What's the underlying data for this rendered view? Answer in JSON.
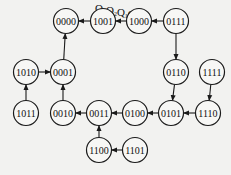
{
  "title": {
    "parts": [
      {
        "letter": "Q",
        "sub": "3"
      },
      {
        "letter": "Q",
        "sub": "2"
      },
      {
        "letter": "Q",
        "sub": "1"
      },
      {
        "letter": "Q",
        "sub": "0"
      }
    ],
    "x": 95,
    "y": 12
  },
  "node_radius": 12.5,
  "nodes": [
    {
      "id": "0000",
      "label": "0000",
      "x": 66,
      "y": 21
    },
    {
      "id": "1001",
      "label": "1001",
      "x": 103,
      "y": 21
    },
    {
      "id": "1000",
      "label": "1000",
      "x": 139,
      "y": 21
    },
    {
      "id": "0111",
      "label": "0111",
      "x": 176,
      "y": 21
    },
    {
      "id": "1010",
      "label": "1010",
      "x": 26,
      "y": 72
    },
    {
      "id": "0001",
      "label": "0001",
      "x": 63,
      "y": 72
    },
    {
      "id": "0110",
      "label": "0110",
      "x": 176,
      "y": 72
    },
    {
      "id": "1111",
      "label": "1111",
      "x": 212,
      "y": 72
    },
    {
      "id": "1011",
      "label": "1011",
      "x": 26,
      "y": 113
    },
    {
      "id": "0010",
      "label": "0010",
      "x": 63,
      "y": 113
    },
    {
      "id": "0011",
      "label": "0011",
      "x": 99,
      "y": 113
    },
    {
      "id": "0100",
      "label": "0100",
      "x": 135,
      "y": 113
    },
    {
      "id": "0101",
      "label": "0101",
      "x": 171,
      "y": 113
    },
    {
      "id": "1110",
      "label": "1110",
      "x": 208,
      "y": 113
    },
    {
      "id": "1100",
      "label": "1100",
      "x": 99,
      "y": 150
    },
    {
      "id": "1101",
      "label": "1101",
      "x": 135,
      "y": 150
    }
  ],
  "edges": [
    {
      "from": "1001",
      "to": "0000"
    },
    {
      "from": "1000",
      "to": "1001"
    },
    {
      "from": "0111",
      "to": "1000"
    },
    {
      "from": "0111",
      "to": "0110"
    },
    {
      "from": "0110",
      "to": "0101"
    },
    {
      "from": "0101",
      "to": "0100"
    },
    {
      "from": "0100",
      "to": "0011"
    },
    {
      "from": "0011",
      "to": "0010"
    },
    {
      "from": "0010",
      "to": "0001"
    },
    {
      "from": "0001",
      "to": "0000"
    },
    {
      "from": "1010",
      "to": "0001"
    },
    {
      "from": "1011",
      "to": "1010"
    },
    {
      "from": "1110",
      "to": "0101"
    },
    {
      "from": "1111",
      "to": "1110"
    },
    {
      "from": "1100",
      "to": "0011"
    },
    {
      "from": "1101",
      "to": "1100"
    }
  ]
}
